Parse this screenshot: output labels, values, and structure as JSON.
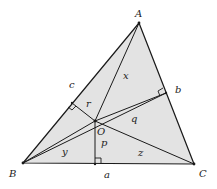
{
  "diagram": {
    "fill_color": "#e3e3e3",
    "line_color": "#1a1a1a",
    "vertices": {
      "A": {
        "label": "A",
        "x": 139,
        "y": 23
      },
      "B": {
        "label": "B",
        "x": 23,
        "y": 163
      },
      "C": {
        "label": "C",
        "x": 194,
        "y": 164
      }
    },
    "center": {
      "label": "O",
      "x": 95,
      "y": 121
    },
    "feet": {
      "a": {
        "label": "a",
        "x": 95,
        "y": 164
      },
      "b": {
        "label": "b",
        "x": 166,
        "y": 93
      },
      "c": {
        "label": "c",
        "x": 72,
        "y": 103
      }
    },
    "segment_labels": {
      "x": "x",
      "y": "y",
      "z": "z",
      "p": "p",
      "q": "q",
      "r": "r"
    }
  }
}
